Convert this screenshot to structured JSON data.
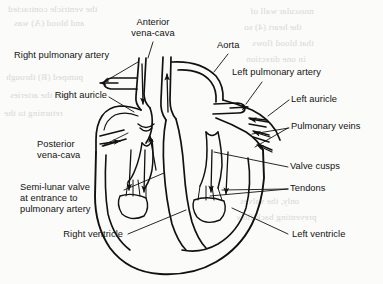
{
  "figure": {
    "style": "line drawing, black ink on off-white paper",
    "colors": {
      "ink": "#111111",
      "paper": "#fbfbf9",
      "bleed_through": "#d9d7d2"
    }
  },
  "labels": {
    "anterior_vena_cava": "Anterior\nvena-cava",
    "anterior_vena_cava_line1": "Anterior",
    "anterior_vena_cava_line2": "vena-cava",
    "aorta": "Aorta",
    "right_pulmonary_artery": "Right pulmonary artery",
    "left_pulmonary_artery": "Left pulmonary artery",
    "right_auricle": "Right auricle",
    "left_auricle": "Left auricle",
    "pulmonary_veins": "Pulmonary veins",
    "posterior_vena_cava_line1": "Posterior",
    "posterior_vena_cava_line2": "vena-cava",
    "valve_cusps": "Valve cusps",
    "tendons": "Tendons",
    "semilunar_valve_line1": "Semi-lunar valve",
    "semilunar_valve_line2": "at entrance to",
    "semilunar_valve_line3": "pulmonary artery",
    "right_ventricle": "Right ventricle",
    "left_ventricle": "Left ventricle"
  },
  "bleed_text": {
    "l1": "the ventricle contracted",
    "l2": "and blood (A) was",
    "l3": "pumped (B) through",
    "l4": "into the arteries",
    "l5": "returning to the",
    "l6": "auricle again and",
    "l7": "so the cycle",
    "r1": "muscular wall of",
    "r2": "the heart (4) so",
    "r3": "that blood flows",
    "r4": "in one direction",
    "r5": "only, the valves",
    "r6": "preventing back flow"
  }
}
